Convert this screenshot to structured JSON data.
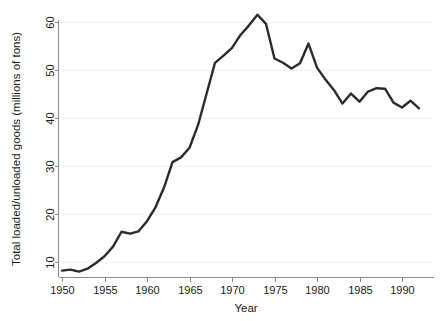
{
  "chart_data": {
    "type": "line",
    "title": "",
    "subtitle": "",
    "xlabel": "Year",
    "ylabel": "Total loaded/unloaded goods (millions of tons)",
    "xlim": [
      1949,
      1993
    ],
    "ylim": [
      7,
      63
    ],
    "xticks": [
      1950,
      1955,
      1960,
      1965,
      1970,
      1975,
      1980,
      1985,
      1990
    ],
    "xtick_labels": [
      "1950",
      "1955",
      "1960",
      "1965",
      "1970",
      "1975",
      "1980",
      "1985",
      "1990"
    ],
    "yticks": [
      10,
      20,
      30,
      40,
      50,
      60
    ],
    "ytick_labels": [
      "10",
      "20",
      "30",
      "40",
      "50",
      "60"
    ],
    "grid": "horizontal-faint",
    "legend": "none",
    "series": [
      {
        "name": "Total loaded/unloaded goods",
        "color": "#2b2b2b",
        "x": [
          1950,
          1951,
          1952,
          1953,
          1954,
          1955,
          1956,
          1957,
          1958,
          1959,
          1960,
          1961,
          1962,
          1963,
          1964,
          1965,
          1966,
          1967,
          1968,
          1969,
          1970,
          1971,
          1972,
          1973,
          1974,
          1975,
          1976,
          1977,
          1978,
          1979,
          1980,
          1981,
          1982,
          1983,
          1984,
          1985,
          1986,
          1987,
          1988,
          1989,
          1990,
          1991,
          1992
        ],
        "values": [
          8.2,
          8.4,
          8.0,
          8.6,
          9.8,
          11.2,
          13.2,
          16.3,
          15.9,
          16.4,
          18.5,
          21.4,
          25.5,
          30.8,
          31.8,
          33.8,
          38.5,
          45.0,
          51.5,
          53.0,
          54.6,
          57.3,
          59.3,
          61.5,
          59.6,
          52.4,
          51.5,
          50.3,
          51.4,
          55.5,
          50.5,
          48.0,
          45.8,
          43.0,
          45.1,
          43.4,
          45.5,
          46.2,
          46.1,
          43.2,
          42.2,
          43.6,
          42.0
        ]
      }
    ],
    "annotations": []
  },
  "axes": {
    "x_axis_name": "year-axis",
    "y_axis_name": "value-axis"
  },
  "colors": {
    "background": "#ffffff",
    "line": "#2b2b2b",
    "axis": "#8a8a8a",
    "gridline": "#f2f2f2",
    "text": "#1a1a1a"
  }
}
